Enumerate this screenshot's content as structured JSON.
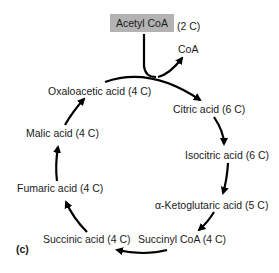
{
  "diagram": {
    "panel_label": "(c)",
    "input": {
      "name": "Acetyl CoA",
      "carbons": "(2 C)"
    },
    "output": {
      "name": "CoA"
    },
    "nodes": [
      {
        "id": "citric",
        "label": "Citric acid (6 C)"
      },
      {
        "id": "isocitric",
        "label": "Isocitric acid (6 C)"
      },
      {
        "id": "ketoglutaric",
        "label": "α-Ketoglutaric acid (5 C)"
      },
      {
        "id": "succinyl_coa",
        "label": "Succinyl CoA (4 C)"
      },
      {
        "id": "succinic",
        "label": "Succinic acid (4 C)"
      },
      {
        "id": "fumaric",
        "label": "Fumaric acid (4 C)"
      },
      {
        "id": "malic",
        "label": "Malic acid (4 C)"
      },
      {
        "id": "oxaloacetic",
        "label": "Oxaloacetic acid (4 C)"
      }
    ],
    "edges": [
      [
        "acetyl_coa+oxaloacetic",
        "citric"
      ],
      [
        "acetyl_coa",
        "coa"
      ],
      [
        "citric",
        "isocitric"
      ],
      [
        "isocitric",
        "ketoglutaric"
      ],
      [
        "ketoglutaric",
        "succinyl_coa"
      ],
      [
        "succinyl_coa",
        "succinic"
      ],
      [
        "succinic",
        "fumaric"
      ],
      [
        "fumaric",
        "malic"
      ],
      [
        "malic",
        "oxaloacetic"
      ]
    ],
    "colors": {
      "box_fill": "#b3b3b3",
      "arrow": "#000000",
      "text": "#1a1a1a"
    }
  }
}
